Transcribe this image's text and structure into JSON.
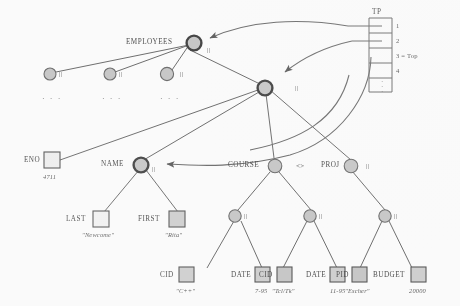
{
  "figure": {
    "type": "object-reference-diagram"
  },
  "table": {
    "header": "TP",
    "rows": [
      {
        "index": "1",
        "label": "1"
      },
      {
        "index": "2",
        "label": "2"
      },
      {
        "index": "3",
        "label": "3 = Top"
      },
      {
        "index": "4",
        "label": "4"
      }
    ],
    "continuation": "·\n·"
  },
  "nodes": {
    "employees": {
      "label": "EMPLOYEES",
      "mark": "||"
    },
    "employee_siblings": [
      {
        "mark": "||",
        "dots": "· · ·"
      },
      {
        "mark": "||",
        "dots": "· · ·"
      },
      {
        "mark": "||",
        "dots": "· · ·"
      }
    ],
    "employee_record": {
      "mark": "||"
    },
    "eno": {
      "label": "ENO",
      "value": "4711"
    },
    "name": {
      "label": "NAME",
      "mark": "||"
    },
    "last": {
      "label": "LAST",
      "value": "\"Newcome\""
    },
    "first": {
      "label": "FIRST",
      "value": "\"Rita\""
    },
    "course": {
      "label": "COURSE",
      "mark": "<>"
    },
    "course_entries": [
      {
        "mark": "||"
      },
      {
        "mark": "||"
      }
    ],
    "course_leaves": [
      {
        "label": "CID",
        "value": "\"C++\""
      },
      {
        "label": "DATE",
        "value": "7-95"
      },
      {
        "label": "CID",
        "value": "\"Tcl/Tk\""
      },
      {
        "label": "DATE",
        "value": "11-95"
      }
    ],
    "proj": {
      "label": "PROJ",
      "mark": "||"
    },
    "proj_entry": {
      "mark": "||"
    },
    "proj_leaves": [
      {
        "label": "PID",
        "value": "\"Escher\""
      },
      {
        "label": "BUDGET",
        "value": "20000"
      }
    ]
  },
  "colors": {
    "stroke": "#6b6b6b",
    "node_fill": "#c9c9c9",
    "box_fill": "#d2d2d2",
    "box_fill_light": "#f2f2f2",
    "text": "#4a4a4a",
    "background": "#ffffff"
  }
}
